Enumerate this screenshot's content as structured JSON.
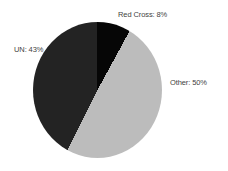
{
  "chart_data": {
    "type": "pie",
    "title": "",
    "legend": "none",
    "labels_outside": true,
    "start_angle_deg": 0,
    "direction": "clockwise",
    "slices": [
      {
        "label": "Red Cross",
        "value": 8,
        "display": "Red Cross: 8%",
        "color": "#060606"
      },
      {
        "label": "Other",
        "value": 50,
        "display": "Other: 50%",
        "color": "#bcbcbc"
      },
      {
        "label": "UN",
        "value": 43,
        "display": "UN: 43%",
        "color": "#232323"
      }
    ],
    "label_text_color": "#3f3f3f",
    "background_color": "#ffffff"
  }
}
